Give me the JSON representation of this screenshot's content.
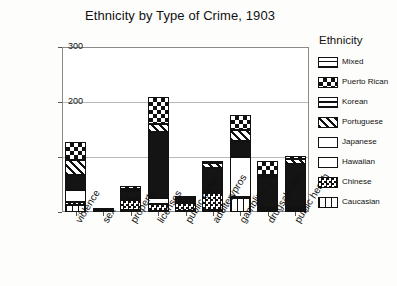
{
  "chart_data": {
    "type": "bar",
    "subtype": "stacked",
    "title": "Ethnicity by Type of Crime, 1903",
    "xlabel": "",
    "ylabel": "Count",
    "ylim": [
      0,
      300
    ],
    "yticks": [
      0,
      100,
      200,
      300
    ],
    "grid": true,
    "legend_title": "Ethnicity",
    "legend_position": "right",
    "categories": [
      "violence",
      "sex",
      "property",
      "licenses",
      "public order",
      "adulterypros",
      "gambling",
      "drugsalcohol",
      "public health"
    ],
    "series": [
      {
        "name": "Caucasian",
        "pattern": "vertical-lines",
        "values": [
          12,
          1,
          3,
          2,
          2,
          4,
          26,
          3,
          2
        ]
      },
      {
        "name": "Chinese",
        "pattern": "fine-checker",
        "values": [
          6,
          1,
          18,
          12,
          14,
          30,
          2,
          2,
          4
        ]
      },
      {
        "name": "Hawaiian",
        "pattern": "solid-white",
        "values": [
          22,
          1,
          5,
          12,
          2,
          4,
          72,
          3,
          3
        ]
      },
      {
        "name": "Japanese",
        "pattern": "solid-black",
        "values": [
          28,
          1,
          13,
          120,
          5,
          42,
          30,
          56,
          78
        ]
      },
      {
        "name": "Portuguese",
        "pattern": "diagonal-lines",
        "values": [
          26,
          0,
          2,
          14,
          2,
          10,
          20,
          4,
          10
        ]
      },
      {
        "name": "Korean",
        "pattern": "horizontal-lines",
        "values": [
          0,
          0,
          0,
          0,
          0,
          0,
          0,
          0,
          0
        ]
      },
      {
        "name": "Puerto Rican",
        "pattern": "coarse-checker",
        "values": [
          34,
          1,
          6,
          50,
          4,
          2,
          26,
          24,
          4
        ]
      },
      {
        "name": "Mixed",
        "pattern": "grid-crosshatch",
        "values": [
          0,
          0,
          0,
          0,
          0,
          0,
          0,
          0,
          0
        ]
      }
    ],
    "totals": [
      128,
      5,
      47,
      210,
      29,
      92,
      176,
      92,
      101
    ]
  },
  "legend": {
    "title": "Ethnicity",
    "items": [
      {
        "label": "Mixed",
        "icon": "swatch-mixed"
      },
      {
        "label": "Puerto Rican",
        "icon": "swatch-puerto-rican"
      },
      {
        "label": "Korean",
        "icon": "swatch-korean"
      },
      {
        "label": "Portuguese",
        "icon": "swatch-portuguese"
      },
      {
        "label": "Japanese",
        "icon": "swatch-japanese"
      },
      {
        "label": "Hawaiian",
        "icon": "swatch-hawaiian"
      },
      {
        "label": "Chinese",
        "icon": "swatch-chinese"
      },
      {
        "label": "Caucasian",
        "icon": "swatch-caucasian"
      }
    ]
  }
}
